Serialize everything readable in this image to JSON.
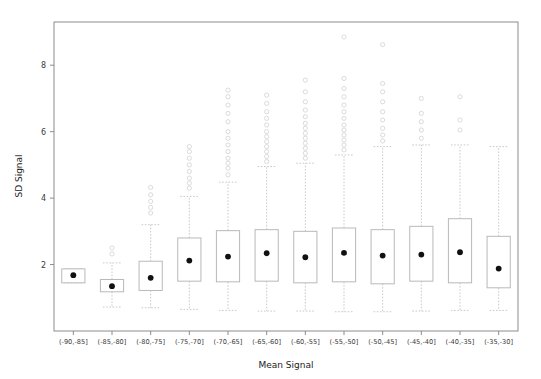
{
  "chart_data": {
    "type": "boxplot",
    "title": "",
    "xlabel": "Mean Signal",
    "ylabel": "SD Signal",
    "ylim": [
      0,
      9.3
    ],
    "yticks": [
      2,
      4,
      6,
      8
    ],
    "grid": false,
    "legend": null,
    "categories": [
      "(-90,-85]",
      "(-85,-80]",
      "(-80,-75]",
      "(-75,-70]",
      "(-70,-65]",
      "(-65,-60]",
      "(-60,-55]",
      "(-55,-50]",
      "(-50,-45]",
      "(-45,-40]",
      "(-40,-35]",
      "(-35,-30]"
    ],
    "boxes": [
      {
        "category": "(-90,-85]",
        "whisker_low": 1.45,
        "q1": 1.45,
        "median": 1.68,
        "q3": 1.87,
        "whisker_high": 1.87,
        "mean": 1.68,
        "outliers": []
      },
      {
        "category": "(-85,-80]",
        "whisker_low": 0.72,
        "q1": 1.18,
        "median": 1.35,
        "q3": 1.55,
        "whisker_high": 2.05,
        "mean": 1.35,
        "outliers": [
          2.32,
          2.5
        ]
      },
      {
        "category": "(-80,-75]",
        "whisker_low": 0.7,
        "q1": 1.22,
        "median": 1.58,
        "q3": 2.1,
        "whisker_high": 3.2,
        "mean": 1.6,
        "outliers": [
          3.55,
          3.72,
          3.9,
          4.1,
          4.32
        ]
      },
      {
        "category": "(-75,-70]",
        "whisker_low": 0.65,
        "q1": 1.5,
        "median": 2.1,
        "q3": 2.8,
        "whisker_high": 4.05,
        "mean": 2.12,
        "outliers": [
          4.3,
          4.45,
          4.6,
          4.8,
          5.0,
          5.2,
          5.4,
          5.55
        ]
      },
      {
        "category": "(-70,-65]",
        "whisker_low": 0.62,
        "q1": 1.48,
        "median": 2.2,
        "q3": 3.02,
        "whisker_high": 4.48,
        "mean": 2.24,
        "outliers": [
          4.7,
          4.9,
          5.05,
          5.2,
          5.4,
          5.6,
          5.8,
          6.0,
          6.3,
          6.55,
          6.8,
          7.05,
          7.25
        ]
      },
      {
        "category": "(-65,-60]",
        "whisker_low": 0.6,
        "q1": 1.5,
        "median": 2.32,
        "q3": 3.05,
        "whisker_high": 4.95,
        "mean": 2.34,
        "outliers": [
          5.1,
          5.25,
          5.4,
          5.55,
          5.7,
          5.85,
          6.0,
          6.2,
          6.4,
          6.6,
          6.85,
          7.1
        ]
      },
      {
        "category": "(-60,-55]",
        "whisker_low": 0.6,
        "q1": 1.45,
        "median": 2.2,
        "q3": 3.0,
        "whisker_high": 5.05,
        "mean": 2.22,
        "outliers": [
          5.2,
          5.35,
          5.5,
          5.65,
          5.8,
          5.95,
          6.1,
          6.25,
          6.45,
          6.65,
          6.9,
          7.2,
          7.55
        ]
      },
      {
        "category": "(-55,-50]",
        "whisker_low": 0.58,
        "q1": 1.48,
        "median": 2.32,
        "q3": 3.1,
        "whisker_high": 5.3,
        "mean": 2.35,
        "outliers": [
          5.45,
          5.6,
          5.75,
          5.9,
          6.05,
          6.2,
          6.4,
          6.6,
          6.8,
          7.05,
          7.3,
          7.6,
          8.85
        ]
      },
      {
        "category": "(-50,-45]",
        "whisker_low": 0.58,
        "q1": 1.42,
        "median": 2.25,
        "q3": 3.05,
        "whisker_high": 5.55,
        "mean": 2.27,
        "outliers": [
          5.72,
          5.9,
          6.1,
          6.35,
          6.6,
          6.9,
          7.2,
          7.45,
          8.62
        ]
      },
      {
        "category": "(-45,-40]",
        "whisker_low": 0.6,
        "q1": 1.5,
        "median": 2.3,
        "q3": 3.15,
        "whisker_high": 5.6,
        "mean": 2.3,
        "outliers": [
          5.8,
          6.05,
          6.3,
          6.55,
          7.0
        ]
      },
      {
        "category": "(-40,-35]",
        "whisker_low": 0.62,
        "q1": 1.45,
        "median": 2.35,
        "q3": 3.38,
        "whisker_high": 5.6,
        "mean": 2.37,
        "outliers": [
          6.05,
          6.35,
          7.05
        ]
      },
      {
        "category": "(-35,-30]",
        "whisker_low": 0.62,
        "q1": 1.3,
        "median": 1.88,
        "q3": 2.85,
        "whisker_high": 5.55,
        "mean": 1.88,
        "outliers": []
      }
    ]
  },
  "colors": {
    "box_stroke": "#b9b9b9",
    "box_fill": "#ffffff",
    "whisker": "#c9c9c9",
    "outlier_stroke": "#cfcfcf",
    "mean_dot": "#111111",
    "axis": "#8c8c8c",
    "text": "#3a3a3a",
    "background": "#ffffff"
  }
}
